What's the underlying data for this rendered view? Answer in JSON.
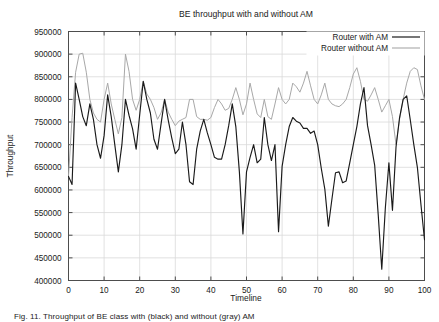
{
  "figure": {
    "caption": "Fig. 11. Throughput of BE class with (black) and without (gray) AM"
  },
  "chart_data": {
    "type": "line",
    "title": "BE throughput with and without AM",
    "xlabel": "Timeline",
    "ylabel": "Throughput",
    "xlim": [
      0,
      100
    ],
    "ylim": [
      400000,
      950000
    ],
    "xticks": [
      0,
      10,
      20,
      30,
      40,
      50,
      60,
      70,
      80,
      90,
      100
    ],
    "yticks": [
      400000,
      450000,
      500000,
      550000,
      600000,
      650000,
      700000,
      750000,
      800000,
      850000,
      900000,
      950000
    ],
    "grid": true,
    "legend_position": "top-right",
    "colors": {
      "with_am": "#1a1a1a",
      "without_am": "#a8a8a8",
      "frame": "#4d4d4d",
      "grid": "#d9d9d9"
    },
    "x": [
      0,
      1,
      2,
      3,
      4,
      5,
      6,
      7,
      8,
      9,
      10,
      11,
      12,
      13,
      14,
      15,
      16,
      17,
      18,
      19,
      20,
      21,
      22,
      23,
      24,
      25,
      26,
      27,
      28,
      29,
      30,
      31,
      32,
      33,
      34,
      35,
      36,
      37,
      38,
      39,
      40,
      41,
      42,
      43,
      44,
      45,
      46,
      47,
      48,
      49,
      50,
      51,
      52,
      53,
      54,
      55,
      56,
      57,
      58,
      59,
      60,
      61,
      62,
      63,
      64,
      65,
      66,
      67,
      68,
      69,
      70,
      71,
      72,
      73,
      74,
      75,
      76,
      77,
      78,
      79,
      80,
      81,
      82,
      83,
      84,
      85,
      86,
      87,
      88,
      89,
      90,
      91,
      92,
      93,
      94,
      95,
      96,
      97,
      98,
      99,
      100
    ],
    "series": [
      {
        "name": "Router with AM",
        "style": "solid",
        "values": [
          630000,
          612000,
          836000,
          800000,
          762000,
          742000,
          790000,
          756000,
          700000,
          670000,
          720000,
          810000,
          762000,
          700000,
          640000,
          700000,
          800000,
          765000,
          735000,
          690000,
          766000,
          840000,
          800000,
          770000,
          712000,
          690000,
          746000,
          800000,
          755000,
          715000,
          680000,
          690000,
          750000,
          700000,
          618000,
          612000,
          690000,
          730000,
          756000,
          726000,
          700000,
          672000,
          668000,
          668000,
          700000,
          742000,
          790000,
          740000,
          640000,
          503000,
          640000,
          672000,
          700000,
          660000,
          668000,
          760000,
          700000,
          665000,
          700000,
          508000,
          652000,
          700000,
          740000,
          760000,
          752000,
          748000,
          736000,
          736000,
          725000,
          730000,
          700000,
          648000,
          602000,
          520000,
          580000,
          638000,
          640000,
          616000,
          620000,
          660000,
          700000,
          740000,
          790000,
          826000,
          742000,
          700000,
          655000,
          545000,
          425000,
          560000,
          660000,
          555000,
          695000,
          760000,
          800000,
          808000,
          755000,
          700000,
          650000,
          568000,
          490000
        ]
      },
      {
        "name": "Router without AM",
        "style": "solid-light",
        "values": [
          630000,
          760000,
          860000,
          900000,
          902000,
          860000,
          800000,
          770000,
          756000,
          750000,
          800000,
          836000,
          790000,
          756000,
          724000,
          760000,
          900000,
          862000,
          800000,
          776000,
          800000,
          840000,
          812000,
          800000,
          782000,
          756000,
          770000,
          800000,
          772000,
          756000,
          742000,
          752000,
          756000,
          760000,
          800000,
          800000,
          762000,
          756000,
          756000,
          754000,
          760000,
          782000,
          800000,
          790000,
          776000,
          780000,
          800000,
          826000,
          800000,
          766000,
          790000,
          836000,
          800000,
          768000,
          760000,
          800000,
          762000,
          756000,
          790000,
          826000,
          800000,
          790000,
          800000,
          836000,
          828000,
          816000,
          836000,
          862000,
          830000,
          800000,
          790000,
          810000,
          836000,
          800000,
          790000,
          786000,
          784000,
          790000,
          800000,
          826000,
          856000,
          870000,
          840000,
          800000,
          796000,
          810000,
          826000,
          800000,
          772000,
          786000,
          800000,
          762000,
          700000,
          756000,
          800000,
          836000,
          862000,
          870000,
          866000,
          830000,
          800000
        ]
      }
    ]
  }
}
